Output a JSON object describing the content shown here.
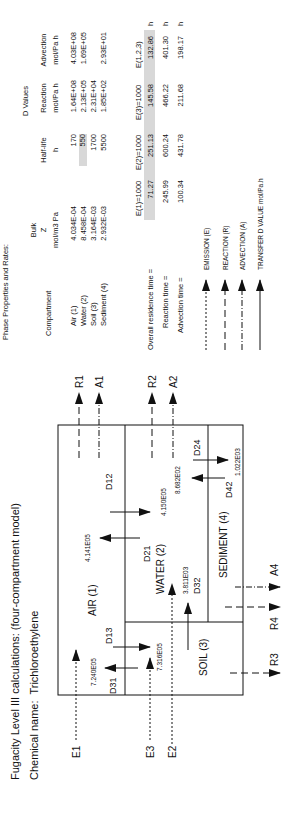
{
  "header": {
    "title": "Fugacity Level III calculations:  (four-compartment model)",
    "chemical_label": "Chemical name:",
    "chemical_name": "Trichloroethylene"
  },
  "diagram": {
    "compartments": {
      "air": "AIR (1)",
      "water": "WATER (2)",
      "soil": "SOIL (3)",
      "sediment": "SEDIMENT (4)"
    },
    "transfers": {
      "D12": {
        "label": "D12",
        "value": "4.150E05"
      },
      "D21": {
        "label": "D21",
        "value": "4.141E05"
      },
      "D13": {
        "label": "D13",
        "value": "7.316E05"
      },
      "D31": {
        "label": "D31",
        "value": "7.240E05"
      },
      "D32": {
        "label": "D32",
        "value": "3.811E03"
      },
      "D24": {
        "label": "D24",
        "value": "1.022E03"
      },
      "D42": {
        "label": "D42",
        "value": "8.682E02"
      }
    },
    "flows": {
      "E1": "E1",
      "E2": "E2",
      "E3": "E3",
      "R1": "R1",
      "R2": "R2",
      "R3": "R3",
      "R4": "R4",
      "A1": "A1",
      "A2": "A2",
      "A4": "A4"
    }
  },
  "table": {
    "heading": "Phase Properties and Rates:",
    "group_header": "D Values",
    "columns": [
      {
        "l1": "",
        "l2": "Compartment",
        "l3": ""
      },
      {
        "l1": "Bulk",
        "l2": "Z",
        "l3": "mol/m3 Pa"
      },
      {
        "l1": "",
        "l2": "Half-life",
        "l3": "h"
      },
      {
        "l1": "",
        "l2": "Reaction",
        "l3": "mol/Pa h"
      },
      {
        "l1": "",
        "l2": "Advection",
        "l3": "mol/Pa h"
      }
    ],
    "rows": [
      {
        "name": "Air (1)",
        "z": "4.034E-04",
        "half_life": "170",
        "reaction": "1.64E+08",
        "advection": "4.03E+08"
      },
      {
        "name": "Water (2)",
        "z": "8.458E-04",
        "half_life": "550",
        "reaction": "2.13E+05",
        "advection": "1.69E+05"
      },
      {
        "name": "Soil (3)",
        "z": "3.164E-03",
        "half_life": "1700",
        "reaction": "2.31E+04",
        "advection": ""
      },
      {
        "name": "Sediment (4)",
        "z": "2.932E-03",
        "half_life": "5500",
        "reaction": "1.85E+02",
        "advection": "2.93E+01"
      }
    ]
  },
  "times": {
    "columns": [
      "E(1)=1000",
      "E(2)=1000",
      "E(3)=1000",
      "E(1,2,3)"
    ],
    "rows": [
      {
        "label": "Overall residence time =",
        "values": [
          "71.27",
          "251.13",
          "145.58",
          "132.86"
        ],
        "unit": "h"
      },
      {
        "label": "Reaction time =",
        "values": [
          "245.99",
          "600.24",
          "466.22",
          "401.30"
        ],
        "unit": "h"
      },
      {
        "label": "Advection time =",
        "values": [
          "100.34",
          "431.78",
          "211.68",
          "198.17"
        ],
        "unit": "h"
      }
    ]
  },
  "legend": [
    {
      "style": "emission",
      "label": "EMISSION (E)"
    },
    {
      "style": "reaction",
      "label": "REACTION (R)"
    },
    {
      "style": "advection",
      "label": "ADVECTION (A)"
    },
    {
      "style": "transfer",
      "label": "TRANSFER D VALUE mol/Pa.h"
    }
  ]
}
